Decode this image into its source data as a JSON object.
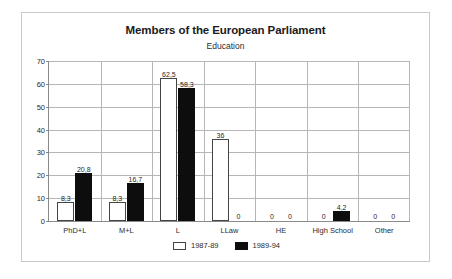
{
  "chart_data": {
    "type": "bar",
    "title": "Members of the European Parliament",
    "subtitle": "Education",
    "xlabel": "",
    "ylabel": "",
    "ylim": [
      0,
      70
    ],
    "yticks": [
      0,
      10,
      20,
      30,
      40,
      50,
      60,
      70
    ],
    "ytick_labels": [
      "0",
      "10",
      "20",
      "30",
      "40",
      "50",
      "60",
      "70"
    ],
    "grid": true,
    "legend_position": "bottom",
    "categories": [
      "PhD+L",
      "M+L",
      "L",
      "LLaw",
      "HE",
      "High School",
      "Other"
    ],
    "series": [
      {
        "name": "1987-89",
        "color": "#ffffff",
        "edge_color": "#444444",
        "values": [
          8.3,
          8.3,
          62.5,
          36,
          0,
          0,
          0
        ],
        "labels": [
          "8,3",
          "8,3",
          "62,5",
          "36",
          "0",
          "0",
          "0"
        ]
      },
      {
        "name": "1989-94",
        "color": "#0d0d0d",
        "edge_color": "#0d0d0d",
        "values": [
          20.8,
          16.7,
          58.3,
          0,
          0,
          4.2,
          0
        ],
        "labels": [
          "20,8",
          "16,7",
          "58,3",
          "0",
          "0",
          "4,2",
          "0"
        ]
      }
    ]
  },
  "colors": {
    "frame": "#c9c9c9",
    "gridline": "#b6b6b6",
    "axis": "#8a8a8a",
    "text": "#2b2b2b",
    "series_1987_89": "#ffffff",
    "series_1989_94": "#0d0d0d"
  }
}
